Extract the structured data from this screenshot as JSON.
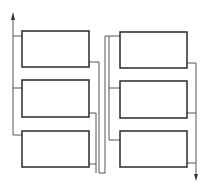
{
  "diagram": {
    "title": "",
    "colors": {
      "stroke": "#2a2a2a",
      "line": "#555555",
      "background": "#ffffff"
    },
    "boxes": [
      {
        "id": "box-left-1",
        "label": "",
        "x": 22,
        "y": 31,
        "w": 67,
        "h": 36
      },
      {
        "id": "box-left-2",
        "label": "",
        "x": 22,
        "y": 80,
        "w": 67,
        "h": 37
      },
      {
        "id": "box-left-3",
        "label": "",
        "x": 22,
        "y": 131,
        "w": 67,
        "h": 36
      },
      {
        "id": "box-right-1",
        "label": "",
        "x": 120,
        "y": 32,
        "w": 67,
        "h": 36
      },
      {
        "id": "box-right-2",
        "label": "",
        "x": 120,
        "y": 81,
        "w": 67,
        "h": 37
      },
      {
        "id": "box-right-3",
        "label": "",
        "x": 120,
        "y": 131,
        "w": 67,
        "h": 36
      }
    ],
    "arrows": [
      {
        "id": "inlet-arrow",
        "direction": "up",
        "x": 13,
        "y": 13
      },
      {
        "id": "outlet-arrow",
        "direction": "down",
        "x": 196,
        "y": 180
      }
    ]
  }
}
